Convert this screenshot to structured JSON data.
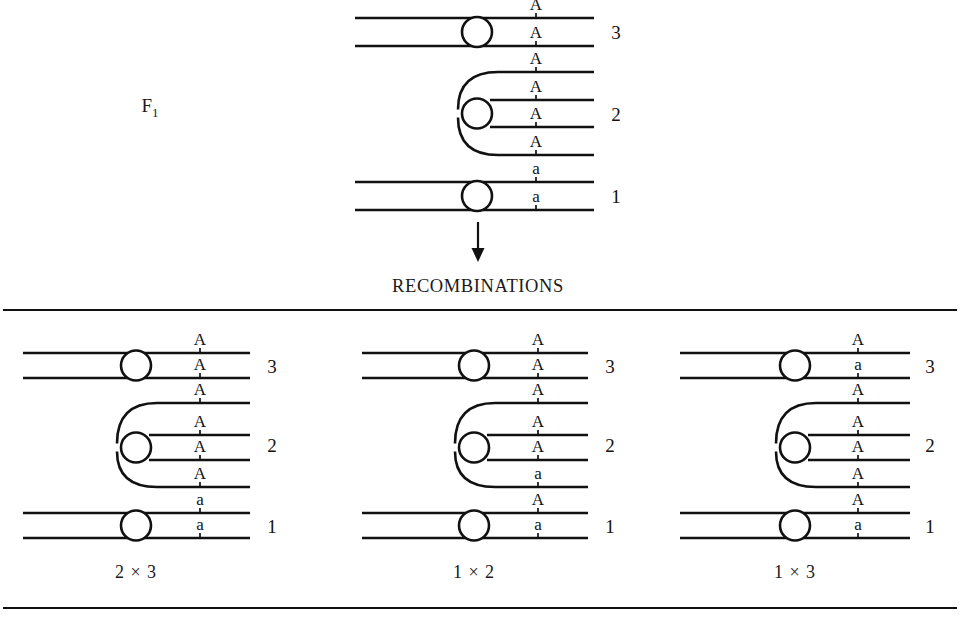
{
  "figure": {
    "stage_label": "F",
    "stage_label_sub": "1",
    "section_heading": "RECOMBINATIONS",
    "arrow_name": "downward-arrow"
  },
  "f1": {
    "name": "F1 parent configuration",
    "groups": [
      {
        "number": "3",
        "strands": 2,
        "alleles": [
          "A",
          "A"
        ]
      },
      {
        "number": "2",
        "strands": 4,
        "alleles": [
          "A",
          "A",
          "A",
          "A"
        ]
      },
      {
        "number": "1",
        "strands": 2,
        "alleles": [
          "a",
          "a"
        ]
      }
    ]
  },
  "recombinations": [
    {
      "caption": "2 × 3",
      "name": "recombination-panel-2x3",
      "groups": [
        {
          "number": "3",
          "strands": 2,
          "alleles": [
            "A",
            "A"
          ]
        },
        {
          "number": "2",
          "strands": 4,
          "alleles": [
            "A",
            "A",
            "A",
            "A"
          ]
        },
        {
          "number": "1",
          "strands": 2,
          "alleles": [
            "a",
            "a"
          ]
        }
      ]
    },
    {
      "caption": "1 × 2",
      "name": "recombination-panel-1x2",
      "groups": [
        {
          "number": "3",
          "strands": 2,
          "alleles": [
            "A",
            "A"
          ]
        },
        {
          "number": "2",
          "strands": 4,
          "alleles": [
            "A",
            "A",
            "A",
            "a"
          ]
        },
        {
          "number": "1",
          "strands": 2,
          "alleles": [
            "A",
            "a"
          ]
        }
      ]
    },
    {
      "caption": "1 × 3",
      "name": "recombination-panel-1x3",
      "groups": [
        {
          "number": "3",
          "strands": 2,
          "alleles": [
            "A",
            "a"
          ]
        },
        {
          "number": "2",
          "strands": 4,
          "alleles": [
            "A",
            "A",
            "A",
            "A"
          ]
        },
        {
          "number": "1",
          "strands": 2,
          "alleles": [
            "A",
            "a"
          ]
        }
      ]
    }
  ],
  "layout": {
    "f1": {
      "x_left": 355,
      "x_right": 594,
      "centromere_x": 477,
      "locus_x": 536,
      "group_number_x": 616,
      "line_ys": [
        18,
        46,
        72,
        100,
        127,
        155,
        182,
        210
      ]
    },
    "panels": [
      {
        "x_left": 23,
        "x_right": 250,
        "centromere_x": 136,
        "locus_x": 200,
        "group_number_x": 272,
        "caption_x": 136,
        "line_ys": [
          353,
          378,
          403,
          435,
          460,
          487,
          513,
          538
        ]
      },
      {
        "x_left": 362,
        "x_right": 588,
        "centromere_x": 474,
        "locus_x": 538,
        "group_number_x": 610,
        "caption_x": 474,
        "line_ys": [
          353,
          378,
          403,
          435,
          460,
          487,
          513,
          538
        ]
      },
      {
        "x_left": 680,
        "x_right": 910,
        "centromere_x": 795,
        "locus_x": 858,
        "group_number_x": 930,
        "caption_x": 795,
        "line_ys": [
          353,
          378,
          403,
          435,
          460,
          487,
          513,
          538
        ]
      }
    ],
    "rules": [
      {
        "y": 310,
        "x1": 3,
        "x2": 957,
        "name": "top-divider-rule"
      },
      {
        "y": 608,
        "x1": 3,
        "x2": 957,
        "name": "bottom-divider-rule"
      }
    ],
    "arrow": {
      "x": 478,
      "y_top": 222,
      "y_bottom": 262
    },
    "stage_label_pos": {
      "x": 150,
      "y": 112
    },
    "heading_pos": {
      "x": 478,
      "y": 292
    },
    "caption_y": 578,
    "centromere_r": 15
  }
}
